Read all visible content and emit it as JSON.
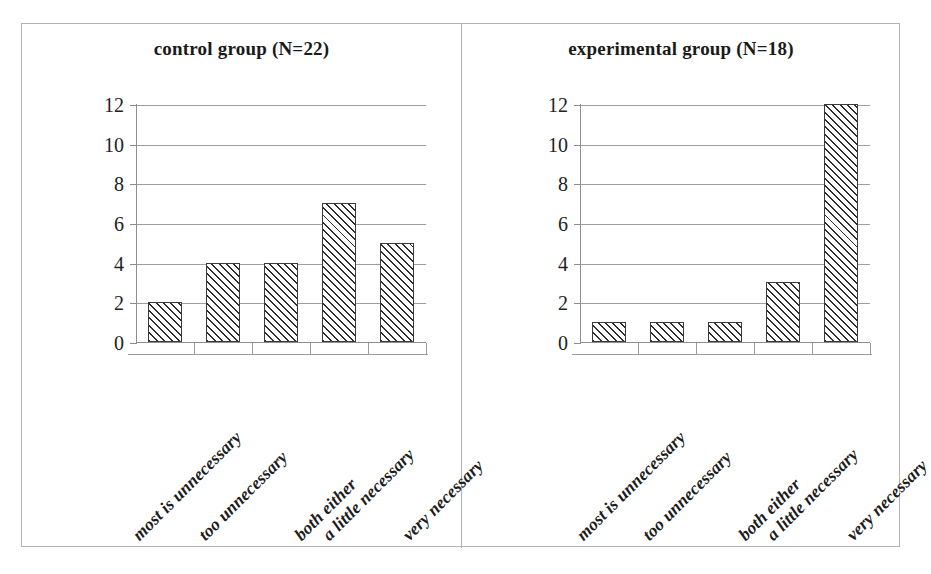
{
  "figure": {
    "border_color": "#b3b3b3",
    "divider_color": "#b0b0b0",
    "background": "#ffffff"
  },
  "chart_data": [
    {
      "type": "bar",
      "title": "control group (N=22)",
      "xlabel": "",
      "ylabel": "",
      "categories": [
        "most is unnecessary",
        "too unnecessary",
        "both either",
        "a little necessary",
        "very necessary"
      ],
      "values": [
        2,
        4,
        4,
        7,
        5
      ],
      "ylim": [
        0,
        12
      ],
      "ytick_labels": [
        "0",
        "2",
        "4",
        "6",
        "8",
        "10",
        "12"
      ],
      "ytick_values": [
        0,
        2,
        4,
        6,
        8,
        10,
        12
      ],
      "grid": true,
      "legend": "none",
      "bar_fill": "hatch-diagonal-45",
      "bar_edge_color": "#3a3a3a",
      "label_rotation": -45,
      "n": 22
    },
    {
      "type": "bar",
      "title": "experimental group (N=18)",
      "xlabel": "",
      "ylabel": "",
      "categories": [
        "most is unnecessary",
        "too unnecessary",
        "both either",
        "a little necessary",
        "very necessary"
      ],
      "values": [
        1,
        1,
        1,
        3,
        12
      ],
      "ylim": [
        0,
        12
      ],
      "ytick_labels": [
        "0",
        "2",
        "4",
        "6",
        "8",
        "10",
        "12"
      ],
      "ytick_values": [
        0,
        2,
        4,
        6,
        8,
        10,
        12
      ],
      "grid": true,
      "legend": "none",
      "bar_fill": "hatch-diagonal-45",
      "bar_edge_color": "#3a3a3a",
      "label_rotation": -45,
      "n": 18
    }
  ]
}
